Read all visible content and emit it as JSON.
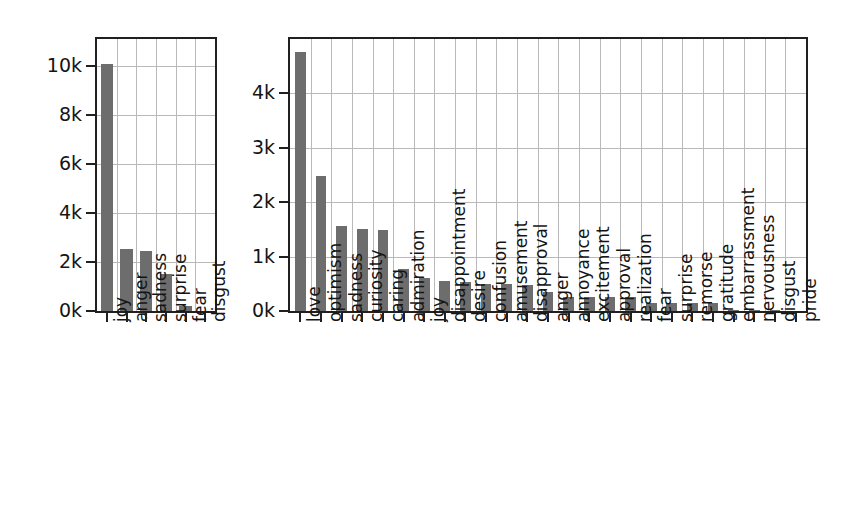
{
  "figure": {
    "background_color": "#ffffff",
    "bar_color": "#6d6d6d",
    "grid_color": "#b9b9b9",
    "axis_color": "#202020",
    "width": 846,
    "height": 530
  },
  "chart_data": [
    {
      "type": "bar",
      "title": "",
      "xlabel": "",
      "ylabel": "",
      "categories": [
        "joy",
        "anger",
        "sadness",
        "surprise",
        "fear",
        "disgust"
      ],
      "values": [
        10100,
        2550,
        2450,
        1500,
        200,
        20
      ],
      "ylim": [
        0,
        11100
      ],
      "yticks": [
        0,
        2000,
        4000,
        6000,
        8000,
        10000
      ],
      "ytick_labels": [
        "0k",
        "2k",
        "4k",
        "6k",
        "8k",
        "10k"
      ],
      "grid": true,
      "legend": "none",
      "panel": "left"
    },
    {
      "type": "bar",
      "title": "",
      "xlabel": "",
      "ylabel": "",
      "categories": [
        "love",
        "optimism",
        "sadness",
        "curiosity",
        "caring",
        "admiration",
        "joy",
        "disappointment",
        "desire",
        "confusion",
        "amusement",
        "disapproval",
        "anger",
        "annoyance",
        "excitement",
        "approval",
        "realization",
        "fear",
        "surprise",
        "remorse",
        "gratitude",
        "embarrassment",
        "nervousness",
        "disgust",
        "pride"
      ],
      "values": [
        4770,
        2480,
        1560,
        1500,
        1490,
        770,
        600,
        560,
        540,
        500,
        490,
        470,
        350,
        260,
        250,
        250,
        250,
        150,
        150,
        150,
        150,
        20,
        15,
        10,
        5
      ],
      "ylim": [
        0,
        5000
      ],
      "yticks": [
        0,
        1000,
        2000,
        3000,
        4000
      ],
      "ytick_labels": [
        "0k",
        "1k",
        "2k",
        "3k",
        "4k"
      ],
      "grid": true,
      "legend": "none",
      "panel": "right"
    }
  ]
}
